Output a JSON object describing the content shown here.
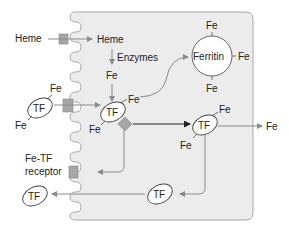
{
  "colors": {
    "cell_fill": "#ececec",
    "cell_stroke": "#a8a8a8",
    "arrow_gray": "#8a8a8a",
    "arrow_dark": "#222222",
    "receptor_fill": "#a6a6a6",
    "ellipse_fill": "#ffffff"
  },
  "labels": {
    "heme_outside": "Heme",
    "heme_inside": "Heme",
    "enzymes": "Enzymes",
    "fe_from_heme": "Fe",
    "ferritin": "Ferritin",
    "ferritin_fe_top": "Fe",
    "ferritin_fe_right": "Fe",
    "ferritin_fe_bottom": "Fe",
    "tf_outside": "TF",
    "tf_outside_fe_top": "Fe",
    "tf_outside_fe_bottom": "Fe",
    "tf_inner": "TF",
    "tf_inner_fe_top": "Fe",
    "tf_inner_fe_bottom": "Fe",
    "tf_exit": "TF",
    "tf_exit_fe_top": "Fe",
    "tf_exit_fe_bottom": "Fe",
    "fe_out": "Fe",
    "receptor_line1": "Fe-TF",
    "receptor_line2": "receptor",
    "tf_recycled_inner": "TF",
    "tf_recycled_outer": "TF"
  }
}
